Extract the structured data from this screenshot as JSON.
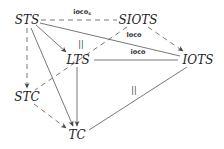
{
  "diagram": {
    "nodes": {
      "sts": "STS",
      "siots": "SIOTS",
      "lts": "LTS",
      "iots": "IOTS",
      "stc": "STC",
      "tc": "TC"
    },
    "edge_labels": {
      "sts_siots": "ioco",
      "sts_siots_sub": "s",
      "sts_iots": "loco",
      "lts_iots": "ioco",
      "lts_eq": "||",
      "tc_iots_eq": "||"
    },
    "edges": [
      {
        "from": "STS",
        "to": "SIOTS",
        "style": "dashed",
        "arrow": false,
        "label": "ioco_s"
      },
      {
        "from": "STS",
        "to": "LTS",
        "style": "solid",
        "arrow": true
      },
      {
        "from": "STS",
        "to": "IOTS",
        "style": "solid",
        "arrow": false,
        "label": "loco"
      },
      {
        "from": "STS",
        "to": "STC",
        "style": "dashed",
        "arrow": true
      },
      {
        "from": "STS",
        "to": "TC",
        "style": "solid",
        "arrow": true
      },
      {
        "from": "SIOTS",
        "to": "IOTS",
        "style": "dashed",
        "arrow": true
      },
      {
        "from": "SIOTS",
        "to": "STC",
        "style": "dashed",
        "arrow": false
      },
      {
        "from": "LTS",
        "to": "IOTS",
        "style": "solid",
        "arrow": false,
        "label": "ioco"
      },
      {
        "from": "LTS",
        "to": "TC",
        "style": "solid",
        "arrow": true
      },
      {
        "from": "STC",
        "to": "TC",
        "style": "dashed",
        "arrow": true
      },
      {
        "from": "IOTS",
        "to": "TC",
        "style": "solid",
        "arrow": false,
        "label": "||"
      }
    ],
    "colors": {
      "line": "#555555",
      "text": "#222222",
      "background": "#ffffff"
    }
  }
}
